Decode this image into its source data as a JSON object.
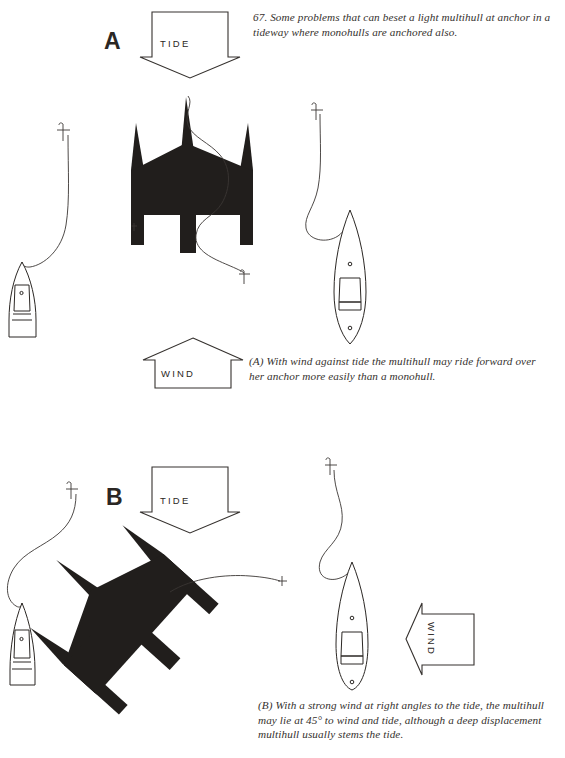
{
  "figure": {
    "number": "67.",
    "main_caption": "67.  Some problems that can beset a light multihull at anchor in a tideway where monohulls are anchored also."
  },
  "panels": [
    {
      "id": "A",
      "letter": "A",
      "caption": "(A)  With wind against tide the multihull may ride forward over her anchor more easily than a monohull.",
      "arrows": [
        {
          "label": "TIDE",
          "direction": "down"
        },
        {
          "label": "WIND",
          "direction": "up"
        }
      ],
      "vessels": [
        {
          "type": "monohull",
          "name": "monohull-left",
          "orientation": "bow-up"
        },
        {
          "type": "trimaran",
          "name": "multihull-center",
          "orientation": "bow-up"
        },
        {
          "type": "monohull",
          "name": "monohull-right",
          "orientation": "bow-up"
        }
      ]
    },
    {
      "id": "B",
      "letter": "B",
      "caption": "(B)  With a strong wind at right angles to the tide, the multihull may lie at 45° to wind and tide, although a deep displacement multihull usually stems the tide.",
      "arrows": [
        {
          "label": "TIDE",
          "direction": "down"
        },
        {
          "label": "WIND",
          "direction": "left"
        }
      ],
      "vessels": [
        {
          "type": "monohull",
          "name": "monohull-left",
          "orientation": "bow-up"
        },
        {
          "type": "trimaran",
          "name": "multihull-center",
          "orientation": "45-degrees"
        },
        {
          "type": "monohull",
          "name": "monohull-right",
          "orientation": "bow-up"
        }
      ]
    }
  ],
  "colors": {
    "background": "#ffffff",
    "ink": "#2b2724",
    "solid_hull": "#211e1c",
    "caption_text": "#35312e"
  }
}
